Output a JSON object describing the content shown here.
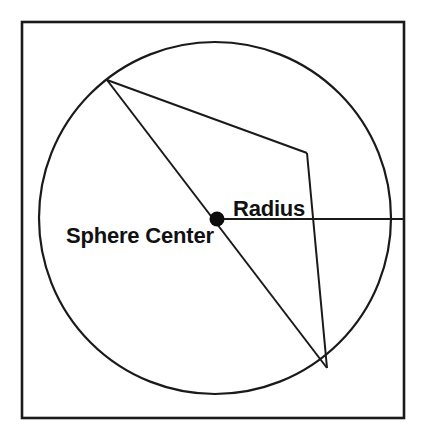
{
  "figure": {
    "name": "sphere-radius-diagram",
    "background_color": "#ffffff",
    "line_color": "#1a1a1a",
    "frame": {
      "x": 22,
      "y": 22,
      "width": 382,
      "height": 396,
      "stroke_width": 2.6
    },
    "sphere": {
      "center_x": 215,
      "center_y": 218,
      "radius_x": 176,
      "radius_y": 176,
      "stroke_width": 2.2
    },
    "center_marker": {
      "x": 217,
      "y": 219,
      "radius": 7.5,
      "color": "#0d0d0d"
    },
    "labels": [
      {
        "id": "sphere-center-label",
        "text": "Sphere Center",
        "x": 66,
        "y": 243,
        "font_size": 22,
        "anchor": "start"
      },
      {
        "id": "radius-label",
        "text": "Radius",
        "x": 233,
        "y": 216,
        "font_size": 22,
        "anchor": "start"
      }
    ],
    "segments": [
      {
        "id": "diameter-line",
        "label": "diameter through sphere center",
        "points": "107,80 327,368"
      },
      {
        "id": "upper-chord-line",
        "label": "chord from upper-left point to bend vertex",
        "points": "107,80 307,153"
      },
      {
        "id": "right-edge-line",
        "label": "line from bend vertex down to lower-right point",
        "points": "307,153 327,368"
      },
      {
        "id": "radius-segment",
        "label": "horizontal radius from center to frame edge",
        "points": "217,219 404,219"
      }
    ],
    "vertices": [
      {
        "id": "upper-left-point",
        "x": 107,
        "y": 80
      },
      {
        "id": "bend-point",
        "x": 307,
        "y": 153
      },
      {
        "id": "lower-right-point",
        "x": 327,
        "y": 368
      },
      {
        "id": "sphere-center-point",
        "x": 217,
        "y": 219
      }
    ]
  }
}
